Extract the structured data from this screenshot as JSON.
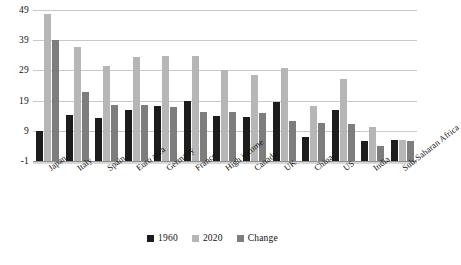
{
  "chart_data": {
    "type": "bar",
    "title": "",
    "subtitle": "",
    "xlabel": "",
    "ylabel": "",
    "ylim": [
      -1,
      49
    ],
    "yticks": [
      -1,
      9,
      19,
      29,
      39,
      49
    ],
    "ytick_labels": [
      "-1",
      "9",
      "19",
      "29",
      "39",
      "49"
    ],
    "grid": true,
    "legend_position": "bottom",
    "categories": [
      "Japan",
      "Italy",
      "Spain",
      "Euro area",
      "Germany",
      "France",
      "High income",
      "Canada",
      "UK",
      "China",
      "US",
      "India",
      "Sub-Saharan Africa"
    ],
    "series": [
      {
        "name": "1960",
        "color": "#1c1c1c",
        "values": [
          8.9,
          14.2,
          13.2,
          15.9,
          17.2,
          19.0,
          14.0,
          13.5,
          18.6,
          6.8,
          16.0,
          5.5,
          6.0
        ]
      },
      {
        "name": "2020",
        "color": "#b6b6b6",
        "values": [
          47.8,
          36.7,
          30.5,
          33.3,
          33.7,
          33.8,
          29.2,
          27.6,
          29.8,
          17.3,
          26.3,
          10.3,
          5.9
        ]
      },
      {
        "name": "Change",
        "color": "#7d7d7d",
        "values": [
          39.0,
          21.8,
          17.7,
          17.6,
          16.8,
          15.1,
          15.2,
          15.0,
          12.3,
          11.7,
          11.4,
          4.0,
          5.7
        ]
      }
    ]
  },
  "legend": {
    "items": [
      {
        "label": "1960",
        "color": "#1c1c1c"
      },
      {
        "label": "2020",
        "color": "#b6b6b6"
      },
      {
        "label": "Change",
        "color": "#7d7d7d"
      }
    ]
  }
}
